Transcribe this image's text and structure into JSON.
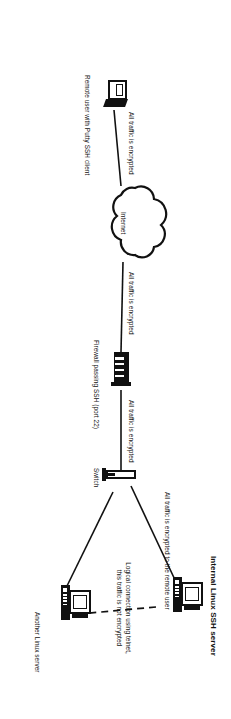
{
  "diagram": {
    "title": "SSH remote access network diagram",
    "orientation": "rotated-90-clockwise",
    "nodes": [
      {
        "id": "remote-user",
        "label": "Remote user with Putty SSH client",
        "icon": "laptop-icon"
      },
      {
        "id": "internet",
        "label": "Internet",
        "icon": "cloud-icon"
      },
      {
        "id": "firewall",
        "label": "Firewall passing SSH (port 22)",
        "icon": "firewall-icon"
      },
      {
        "id": "switch",
        "label": "Switch",
        "icon": "switch-icon"
      },
      {
        "id": "ssh-server",
        "label": "Internal Linux SSH server",
        "icon": "desktop-computer-icon"
      },
      {
        "id": "another-server",
        "label": "Another Linux server",
        "icon": "desktop-computer-icon"
      }
    ],
    "edge_labels": {
      "user_to_internet": "All traffic is encrypted",
      "internet_to_firewall": "All traffic is encrypted",
      "firewall_to_switch": "All traffic is encrypted",
      "switch_to_server": "All traffic is encrypted to the remote user",
      "telnet_line_1": "Logical connection using telnet,",
      "telnet_line_2": "this traffic is not encrypted"
    },
    "colors": {
      "ink": "#111111",
      "background": "#ffffff"
    }
  }
}
